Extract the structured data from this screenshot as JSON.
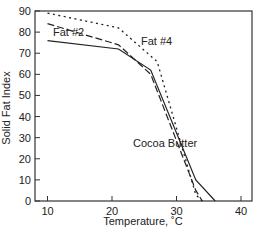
{
  "chart_data": {
    "type": "line",
    "title": "",
    "xlabel": "Temperature, ˚C",
    "ylabel": "Solid Fat Index",
    "xlim": [
      8,
      42
    ],
    "ylim": [
      0,
      90
    ],
    "xticks": [
      10,
      20,
      30,
      40
    ],
    "yticks": [
      0,
      10,
      20,
      30,
      40,
      50,
      60,
      70,
      80,
      90
    ],
    "grid": false,
    "legend": "inline labels",
    "series": [
      {
        "name": "Cocoa Butter",
        "style": "solid",
        "x": [
          10,
          21,
          26,
          33,
          36
        ],
        "y": [
          76,
          72,
          62,
          10,
          0
        ]
      },
      {
        "name": "Fat #2",
        "style": "dashed",
        "x": [
          10,
          21,
          26,
          33,
          34
        ],
        "y": [
          84,
          74,
          60,
          5,
          0
        ]
      },
      {
        "name": "Fat #4",
        "style": "dotted",
        "x": [
          10,
          21,
          27,
          33,
          34
        ],
        "y": [
          89,
          82,
          66,
          3,
          0
        ]
      }
    ],
    "annotations": [
      {
        "text": "Fat #2",
        "x": 13,
        "y": 79
      },
      {
        "text": "Fat #4",
        "x": 25.5,
        "y": 78
      },
      {
        "text": "Cocoa Butter",
        "x": 24,
        "y": 27
      }
    ]
  },
  "labels": {
    "xlabel": "Temperature, ˚C",
    "ylabel": "Solid Fat Index",
    "fat2": "Fat #2",
    "fat4": "Fat #4",
    "cocoa": "Cocoa Butter"
  }
}
